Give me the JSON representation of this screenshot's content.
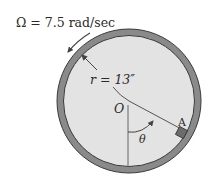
{
  "diagram": {
    "angular_velocity_label": "Ω = 7.5 rad/sec",
    "radius_label": "r = 13″",
    "center_label": "O",
    "angle_label": "θ",
    "block_label": "A",
    "colors": {
      "ring": "#7a7a7a",
      "ring_edge": "#3a3a3a",
      "disk_fill": "#e3e3e3",
      "block": "#6b6b6b",
      "line": "#555555",
      "text": "#2a2a2a"
    }
  }
}
